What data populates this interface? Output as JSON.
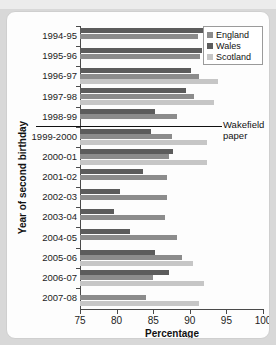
{
  "chart_data": {
    "type": "bar",
    "orientation": "horizontal",
    "title": "",
    "xlabel": "Percentage",
    "ylabel": "Year of second birthday",
    "xlim": [
      75,
      100
    ],
    "xticks": [
      75,
      80,
      85,
      90,
      95,
      100
    ],
    "grid": false,
    "legend_position": "top-right",
    "categories": [
      "1994-95",
      "1995-96",
      "1996-97",
      "1997-98",
      "1998-99",
      "1999-2000",
      "2000-01",
      "2001-02",
      "2002-03",
      "2003-04",
      "2004-05",
      "2005-06",
      "2006-07",
      "2007-08"
    ],
    "series": [
      {
        "name": "England",
        "color": "#8c8c8c",
        "values": [
          91.1,
          91.4,
          91.3,
          90.6,
          88.3,
          87.6,
          87.1,
          86.9,
          86.9,
          86.6,
          88.3,
          88.9,
          85.0,
          84.0
        ]
      },
      {
        "name": "Wales",
        "color": "#5c5c5c",
        "values": [
          91.8,
          91.6,
          90.2,
          89.5,
          85.3,
          84.7,
          87.7,
          83.6,
          80.5,
          79.7,
          81.8,
          85.2,
          87.1,
          null
        ]
      },
      {
        "name": "Scotland",
        "color": "#c6c6c6",
        "values": [
          null,
          null,
          93.9,
          93.3,
          null,
          92.4,
          92.3,
          null,
          null,
          null,
          null,
          90.5,
          91.9,
          91.3
        ]
      }
    ],
    "annotations": [
      {
        "label": "Wakefield paper",
        "at_category_boundary": "1998-99 / 1999-2000"
      }
    ]
  },
  "legend": {
    "items": [
      {
        "label": "England"
      },
      {
        "label": "Wales"
      },
      {
        "label": "Scotland"
      }
    ]
  },
  "annotation": {
    "line1": "Wakefield",
    "line2": "paper"
  }
}
